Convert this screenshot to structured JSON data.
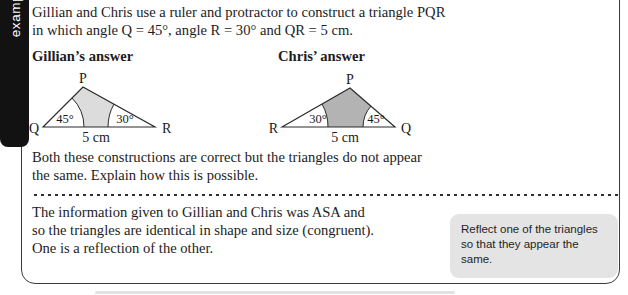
{
  "tab": {
    "label": "example"
  },
  "problem": {
    "line1": "Gillian and Chris use a ruler and protractor to construct a triangle PQR",
    "line2": "in which angle Q = 45°, angle R = 30° and QR = 5 cm."
  },
  "gillian": {
    "heading": "Gillian’s answer",
    "apex": "P",
    "left_vertex": "Q",
    "right_vertex": "R",
    "left_angle": "45°",
    "right_angle": "30°",
    "base": "5 cm",
    "fill": "#dcdcdc"
  },
  "chris": {
    "heading": "Chris’ answer",
    "apex": "P",
    "left_vertex": "R",
    "right_vertex": "Q",
    "left_angle": "30°",
    "right_angle": "45°",
    "base": "5 cm",
    "fill": "#b3b3b3"
  },
  "question": {
    "line1": "Both these constructions are correct but the triangles do not appear",
    "line2": "the same. Explain how this is possible."
  },
  "solution": {
    "line1": "The information given to Gillian and Chris was ASA and",
    "line2": "so the triangles are identical in shape and size (congruent).",
    "line3": "One is a reflection of the other."
  },
  "callout": {
    "text": "Reflect one of the triangles so that they appear the same.",
    "bg": "#e4e4e4"
  },
  "colors": {
    "box_border": "#3c3c3c",
    "tab_bg": "#121212",
    "gillian_fill": "#dcdcdc",
    "chris_fill": "#b3b3b3",
    "callout_bg": "#e4e4e4"
  }
}
